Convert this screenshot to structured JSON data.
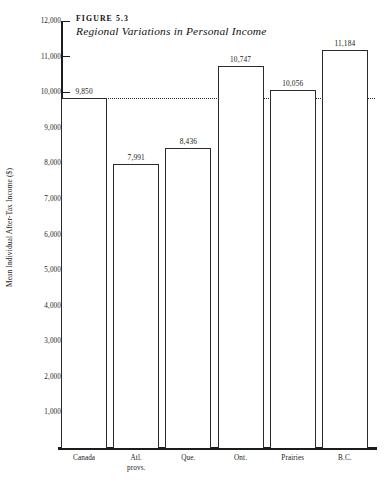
{
  "figure": {
    "number_label": "FIGURE 5.3",
    "title": "Regional Variations in Personal Income"
  },
  "chart_data": {
    "type": "bar",
    "title": "Regional Variations in Personal Income",
    "xlabel": "",
    "ylabel": "Mean Individual After-Tax Income ($)",
    "categories": [
      "Canada",
      "Atl. provs.",
      "Que.",
      "Ont.",
      "Prairies",
      "B.C."
    ],
    "values": [
      9850,
      7991,
      8436,
      10747,
      10056,
      11184
    ],
    "value_labels": [
      "9,850",
      "7,991",
      "8,436",
      "10,747",
      "10,056",
      "11,184"
    ],
    "ylim": [
      0,
      12000
    ],
    "ytick_values": [
      1000,
      2000,
      3000,
      4000,
      5000,
      6000,
      7000,
      8000,
      9000,
      10000,
      11000,
      12000
    ],
    "ytick_labels": [
      "1,000",
      "2,000",
      "3,000",
      "4,000",
      "5,000",
      "6,000",
      "7,000",
      "8,000",
      "9,000",
      "10,000",
      "11,000",
      "12,000"
    ],
    "grid": false,
    "legend": null,
    "reference_line": {
      "value": 9850,
      "label": "Canada national mean",
      "style": "dotted"
    },
    "colors": {
      "bar_fill": "#ffffff",
      "bar_edge": "#2b2b2b",
      "axis": "#1c1c1c",
      "text": "#1a1a1a"
    }
  },
  "xtick_label_lines": [
    [
      "Canada"
    ],
    [
      "Atl.",
      "provs."
    ],
    [
      "Que."
    ],
    [
      "Ont."
    ],
    [
      "Prairies"
    ],
    [
      "B.C."
    ]
  ]
}
